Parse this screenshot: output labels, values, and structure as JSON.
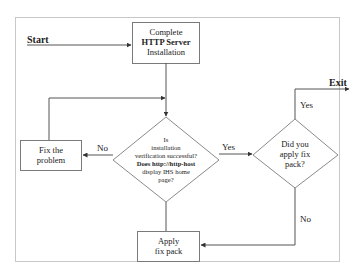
{
  "diagram": {
    "type": "flowchart",
    "start_label": "Start",
    "exit_label": "Exit",
    "nodes": {
      "complete_install": {
        "shape": "rectangle",
        "line1": "Complete",
        "line2": "HTTP Server",
        "line3": "Installation"
      },
      "verify": {
        "shape": "diamond",
        "line1": "Is",
        "line2": "installation",
        "line3": "verification successful?",
        "line4": "Does http://http-host",
        "line5": "display IHS home",
        "line6": "page?"
      },
      "fix_problem": {
        "shape": "rectangle",
        "line1": "Fix the",
        "line2": "problem"
      },
      "fix_pack_question": {
        "shape": "diamond",
        "line1": "Did you",
        "line2": "apply fix",
        "line3": "pack?"
      },
      "apply_fix_pack": {
        "shape": "rectangle",
        "line1": "Apply",
        "line2": "fix pack"
      }
    },
    "edges": [
      {
        "from": "start",
        "to": "complete_install",
        "label": ""
      },
      {
        "from": "complete_install",
        "to": "verify",
        "label": ""
      },
      {
        "from": "verify",
        "to": "fix_problem",
        "label": "No"
      },
      {
        "from": "fix_problem",
        "to": "verify",
        "label": ""
      },
      {
        "from": "verify",
        "to": "fix_pack_question",
        "label": "Yes"
      },
      {
        "from": "fix_pack_question",
        "to": "exit",
        "label": "Yes"
      },
      {
        "from": "fix_pack_question",
        "to": "apply_fix_pack",
        "label": "No"
      },
      {
        "from": "apply_fix_pack",
        "to": "verify",
        "label": ""
      }
    ],
    "edge_labels": {
      "verify_no": "No",
      "verify_yes": "Yes",
      "fixpack_yes": "Yes",
      "fixpack_no": "No"
    },
    "colors": {
      "line": "#555555",
      "shape_border": "#7a7a7a",
      "frame_border": "#c8c8c8",
      "text": "#222222"
    }
  }
}
